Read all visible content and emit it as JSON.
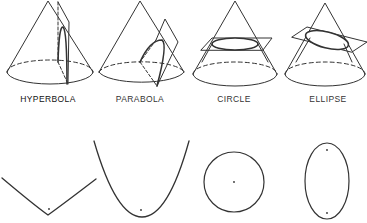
{
  "stroke_color": "#333333",
  "sections": [
    {
      "id": "hyperbola",
      "label": "HYPERBOLA",
      "label_x": 48
    },
    {
      "id": "parabola",
      "label": "PARABOLA",
      "label_x": 140
    },
    {
      "id": "circle",
      "label": "CIRCLE",
      "label_x": 234
    },
    {
      "id": "ellipse",
      "label": "ELLIPSE",
      "label_x": 328
    }
  ],
  "curves": [
    {
      "id": "hyperbola-curve",
      "type": "hyperbola",
      "vertex": [
        48,
        215
      ],
      "focus": [
        49,
        210
      ]
    },
    {
      "id": "parabola-curve",
      "type": "parabola",
      "vertex": [
        142,
        217
      ],
      "focus": [
        141,
        210
      ]
    },
    {
      "id": "circle-curve",
      "type": "circle",
      "center": [
        234,
        182
      ],
      "radius": 30
    },
    {
      "id": "ellipse-curve",
      "type": "ellipse",
      "center": [
        327,
        182
      ],
      "rx": 22,
      "ry": 38,
      "foci": [
        [
          327,
          150
        ],
        [
          327,
          214
        ]
      ]
    }
  ]
}
